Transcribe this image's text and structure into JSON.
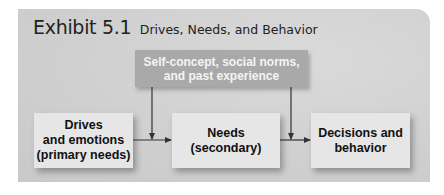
{
  "exhibit": {
    "label": "Exhibit 5.1",
    "title": "Drives, Needs, and Behavior"
  },
  "diagram": {
    "influence_box": {
      "line1": "Self-concept, social norms,",
      "line2": "and past experience"
    },
    "flow_boxes": [
      {
        "line1": "Drives",
        "line2": "and emotions",
        "line3": "(primary needs)"
      },
      {
        "line1": "Needs",
        "line2": "(secondary)"
      },
      {
        "line1": "Decisions and",
        "line2": "behavior"
      }
    ],
    "connections": [
      {
        "from": "Drives and emotions (primary needs)",
        "to": "Needs (secondary)"
      },
      {
        "from": "Needs (secondary)",
        "to": "Decisions and behavior"
      },
      {
        "from": "Self-concept, social norms, and past experience",
        "to": "arrow 1"
      },
      {
        "from": "Self-concept, social norms, and past experience",
        "to": "arrow 2"
      }
    ]
  },
  "colors": {
    "panel": "#d2d2d2",
    "influence_box": "#a9a9a9",
    "flow_box": "#e6e6e6",
    "arrow": "#333333"
  }
}
